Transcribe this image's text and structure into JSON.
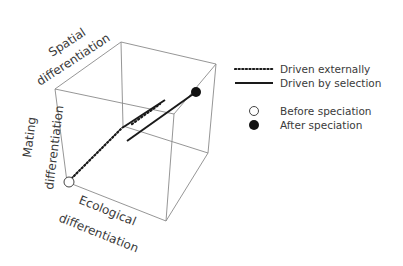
{
  "diagram": {
    "type": "3d-cube-trajectory",
    "axes": {
      "x": "Ecological differentiation",
      "y": "Mating differentiation",
      "z": "Spatial differentiation"
    },
    "labels": {
      "spatial_line1": "Spatial",
      "spatial_line2": "differentiation",
      "mating_line1": "Mating",
      "mating_line2": "differentiation",
      "ecological_line1": "Ecological",
      "ecological_line2": "differentiation"
    },
    "points": {
      "start": {
        "label": "Before speciation",
        "fill": "#ffffff"
      },
      "end": {
        "label": "After speciation",
        "fill": "#111111"
      }
    }
  },
  "legend": {
    "items": [
      {
        "style": "dotted",
        "label": "Driven externally"
      },
      {
        "style": "solid",
        "label": "Driven by selection"
      },
      {
        "style": "open-circle",
        "label": "Before speciation"
      },
      {
        "style": "filled-circle",
        "label": "After speciation"
      }
    ]
  },
  "colors": {
    "cube_edge": "#8a8a8a",
    "trajectory": "#1a1a1a",
    "text": "#3a3a3a"
  }
}
